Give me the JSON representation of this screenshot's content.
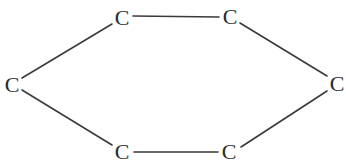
{
  "diagram": {
    "type": "molecular-structure",
    "colors": {
      "background": "#ffffff",
      "bond": "#3a3a3a",
      "label": "#2a2a2a"
    },
    "atoms": [
      {
        "id": "c1",
        "label": "C",
        "x": 12,
        "y": 84
      },
      {
        "id": "c2",
        "label": "C",
        "x": 122,
        "y": 17
      },
      {
        "id": "c3",
        "label": "C",
        "x": 230,
        "y": 16
      },
      {
        "id": "c4",
        "label": "C",
        "x": 337,
        "y": 83
      },
      {
        "id": "c5",
        "label": "C",
        "x": 229,
        "y": 151
      },
      {
        "id": "c6",
        "label": "C",
        "x": 122,
        "y": 151
      }
    ],
    "bonds": [
      {
        "from": "c1",
        "to": "c2",
        "x1": 22,
        "y1": 78,
        "x2": 112,
        "y2": 24
      },
      {
        "from": "c2",
        "to": "c3",
        "x1": 133,
        "y1": 16,
        "x2": 219,
        "y2": 17
      },
      {
        "from": "c3",
        "to": "c4",
        "x1": 240,
        "y1": 23,
        "x2": 327,
        "y2": 76
      },
      {
        "from": "c4",
        "to": "c5",
        "x1": 327,
        "y1": 91,
        "x2": 241,
        "y2": 147
      },
      {
        "from": "c5",
        "to": "c6",
        "x1": 218,
        "y1": 152,
        "x2": 134,
        "y2": 152
      },
      {
        "from": "c6",
        "to": "c1",
        "x1": 112,
        "y1": 145,
        "x2": 22,
        "y2": 90
      }
    ]
  }
}
